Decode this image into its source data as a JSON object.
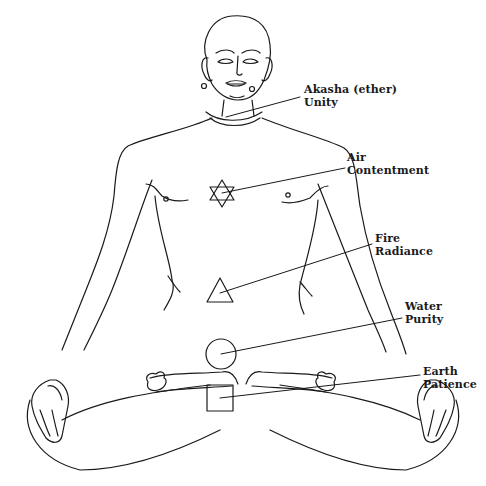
{
  "diagram": {
    "type": "chakra-element-figure",
    "line_color": "#1a1a1a",
    "background": "#ffffff"
  },
  "labels": [
    {
      "element": "Akasha (ether)",
      "quality": "Unity",
      "symbol": "collar-ring",
      "symbol_icon": "neck-ring-icon"
    },
    {
      "element": "Air",
      "quality": "Contentment",
      "symbol": "hexagram",
      "symbol_icon": "hexagram-icon"
    },
    {
      "element": "Fire",
      "quality": "Radiance",
      "symbol": "triangle",
      "symbol_icon": "triangle-icon"
    },
    {
      "element": "Water",
      "quality": "Purity",
      "symbol": "circle",
      "symbol_icon": "circle-icon"
    },
    {
      "element": "Earth",
      "quality": "Patience",
      "symbol": "square",
      "symbol_icon": "square-icon"
    }
  ]
}
